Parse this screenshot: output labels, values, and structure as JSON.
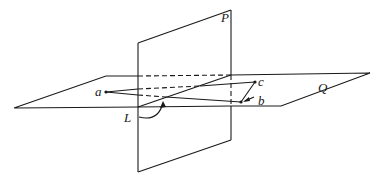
{
  "figure": {
    "labels": {
      "P": "P",
      "Q": "Q",
      "L": "L",
      "a": "a",
      "b": "b",
      "c": "c"
    },
    "colors": {
      "stroke": "#1a1a1a",
      "background": "#ffffff"
    }
  }
}
